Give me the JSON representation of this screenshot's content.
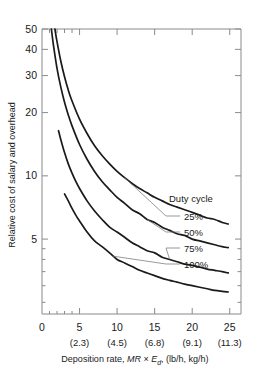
{
  "chart_data": {
    "type": "line",
    "title": "",
    "xlabel": "Deposition rate, MR × E_d, (lb/h, kg/h)",
    "xlabel_parts": {
      "lead": "Deposition rate, ",
      "italic1": "MR",
      "times": " × ",
      "italic2": "E",
      "subscript": "d",
      "trail": ", (lb/h, kg/h)"
    },
    "ylabel": "Relative cost of salary and overhead",
    "xlim": [
      0,
      26.5
    ],
    "ylim": [
      2.2,
      50
    ],
    "yscale": "log",
    "grid": false,
    "legend_position": "inside-right",
    "legend_title": "Duty cycle",
    "x_ticks": [
      0,
      5,
      10,
      15,
      20,
      25
    ],
    "x_tick_labels": [
      "0",
      "5",
      "10",
      "15",
      "20",
      "25"
    ],
    "x_tick_labels_secondary": [
      "",
      "(2.3)",
      "(4.5)",
      "(6.8)",
      "(9.1)",
      "(11.3)"
    ],
    "x_minor_ticks": [
      1,
      2,
      3,
      4
    ],
    "y_ticks": [
      5,
      10,
      20,
      30,
      40,
      50
    ],
    "y_tick_labels": [
      "5",
      "10",
      "20",
      "30",
      "40",
      "50"
    ],
    "y_minor_ticks": [
      2.5,
      3,
      3.5,
      4,
      4.5
    ],
    "series": [
      {
        "name": "25%",
        "label": "25%",
        "color": "#1a1a1a",
        "x": [
          1.72,
          2.0,
          2.5,
          3.0,
          3.5,
          4.0,
          5.0,
          6.0,
          7.0,
          8.0,
          9.0,
          10.0,
          11.0,
          12.0,
          13.0,
          14.0,
          15.0,
          16.0,
          17.0,
          18.0,
          19.0,
          20.0,
          21.0,
          22.0,
          23.0,
          24.0,
          24.8
        ],
        "y": [
          50.0,
          43.5,
          35.2,
          29.6,
          25.6,
          22.7,
          18.6,
          15.9,
          13.9,
          12.5,
          11.4,
          10.5,
          9.8,
          9.2,
          8.7,
          8.3,
          7.9,
          7.6,
          7.3,
          7.1,
          6.9,
          6.7,
          6.5,
          6.3,
          6.2,
          6.0,
          5.9
        ]
      },
      {
        "name": "50%",
        "label": "50%",
        "color": "#1a1a1a",
        "x": [
          1.25,
          1.5,
          2.0,
          2.5,
          3.0,
          3.5,
          4.0,
          5.0,
          6.0,
          7.0,
          8.0,
          9.0,
          10.0,
          11.0,
          12.0,
          13.0,
          14.0,
          15.0,
          16.0,
          17.0,
          18.0,
          19.0,
          20.0,
          21.0,
          22.0,
          23.0,
          24.0,
          24.8
        ],
        "y": [
          50.0,
          42.5,
          32.5,
          26.5,
          22.4,
          19.5,
          17.3,
          14.1,
          12.0,
          10.5,
          9.4,
          8.6,
          7.9,
          7.4,
          6.9,
          6.6,
          6.2,
          6.0,
          5.7,
          5.5,
          5.3,
          5.2,
          5.0,
          4.9,
          4.8,
          4.7,
          4.6,
          4.55
        ]
      },
      {
        "name": "75%",
        "label": "75%",
        "color": "#1a1a1a",
        "x": [
          2.2,
          2.5,
          3.0,
          3.5,
          4.0,
          4.5,
          5.0,
          6.0,
          7.0,
          8.0,
          9.0,
          10.0,
          11.0,
          12.0,
          13.0,
          14.0,
          15.0,
          16.0,
          17.0,
          18.0,
          19.0,
          20.0,
          21.0,
          22.0,
          23.0,
          24.0,
          24.8
        ],
        "y": [
          16.4,
          14.9,
          12.9,
          11.4,
          10.3,
          9.4,
          8.7,
          7.6,
          6.8,
          6.2,
          5.7,
          5.4,
          5.1,
          4.8,
          4.6,
          4.4,
          4.3,
          4.1,
          4.0,
          3.9,
          3.8,
          3.75,
          3.68,
          3.6,
          3.55,
          3.5,
          3.45
        ]
      },
      {
        "name": "100%",
        "label": "100%",
        "color": "#1a1a1a",
        "x": [
          3.0,
          3.5,
          4.0,
          4.5,
          5.0,
          6.0,
          7.0,
          8.0,
          9.0,
          10.0,
          11.0,
          12.0,
          13.0,
          14.0,
          15.0,
          16.0,
          17.0,
          18.0,
          19.0,
          20.0,
          21.0,
          22.0,
          23.0,
          24.0,
          24.8
        ],
        "y": [
          8.2,
          7.6,
          7.0,
          6.5,
          6.1,
          5.4,
          4.9,
          4.6,
          4.3,
          4.0,
          3.85,
          3.7,
          3.55,
          3.45,
          3.35,
          3.25,
          3.18,
          3.12,
          3.05,
          3.0,
          2.95,
          2.9,
          2.85,
          2.82,
          2.8
        ]
      }
    ],
    "legend_entries": [
      {
        "label": "25%",
        "anchor_x": 11.0,
        "anchor_y": 9.8
      },
      {
        "label": "50%",
        "anchor_x": 14.0,
        "anchor_y": 6.2
      },
      {
        "label": "75%",
        "anchor_x": 17.0,
        "anchor_y": 4.0
      },
      {
        "label": "100%",
        "anchor_x": 9.4,
        "anchor_y": 4.15
      }
    ]
  },
  "colors": {
    "curve": "#1a1a1a",
    "axis": "#8a8a8a",
    "leader": "#6f6f6f",
    "background": "#ffffff"
  }
}
